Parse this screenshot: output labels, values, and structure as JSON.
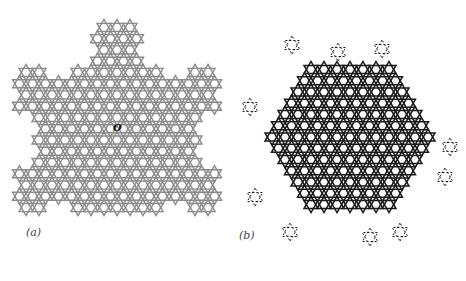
{
  "figure": {
    "panels": [
      {
        "label": "(a)",
        "description": "Grey Kagome-like tiling with snowflake (Koch-curve) boundary, origin marked",
        "line_color": "#8a8a8a",
        "marker": "O"
      },
      {
        "label": "(b)",
        "description": "Black Kagome tiling in hexagonal region with fragmented triangular protrusions",
        "line_color": "#1a1a1a"
      }
    ]
  }
}
